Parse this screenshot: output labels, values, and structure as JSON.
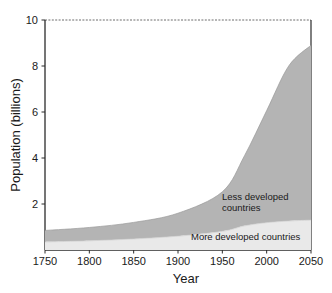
{
  "chart_data": {
    "type": "area",
    "title": "",
    "subtitle": "",
    "xlabel": "Year",
    "ylabel": "Population (billions)",
    "xlim": [
      1750,
      2050
    ],
    "ylim": [
      0,
      10
    ],
    "grid": false,
    "stacked": true,
    "legend_position": "inline-annotation",
    "xticks": [
      1750,
      1800,
      1850,
      1900,
      1950,
      2000,
      2050
    ],
    "xtick_labels": [
      "1750",
      "1800",
      "1850",
      "1900",
      "1950",
      "2000",
      "2050"
    ],
    "yticks": [
      2,
      4,
      6,
      8,
      10
    ],
    "ytick_labels": [
      "2",
      "4",
      "6",
      "8",
      "10"
    ],
    "x": [
      1750,
      1800,
      1850,
      1900,
      1950,
      1975,
      2000,
      2025,
      2050
    ],
    "series": [
      {
        "name": "More developed countries",
        "color": "#e9e9e9",
        "values": [
          0.35,
          0.4,
          0.48,
          0.6,
          0.81,
          1.05,
          1.19,
          1.26,
          1.3
        ]
      },
      {
        "name": "Less developed countries",
        "color": "#b4b4b4",
        "values": [
          0.5,
          0.58,
          0.72,
          1.0,
          1.72,
          3.05,
          4.87,
          6.75,
          7.6
        ]
      }
    ],
    "annotations": [
      {
        "name": "less-developed-label",
        "lines": [
          "Less developed",
          "countries"
        ],
        "x": 1980,
        "y": 2.6
      },
      {
        "name": "more-developed-label",
        "lines": [
          "More developed countries"
        ],
        "x": 1955,
        "y": 0.55
      }
    ]
  },
  "axes": {
    "x_title": "Year",
    "y_title": "Population (billions)"
  },
  "colors": {
    "less_developed": "#b4b4b4",
    "more_developed": "#e9e9e9",
    "axis": "#2b2b2b",
    "background": "#ffffff"
  }
}
